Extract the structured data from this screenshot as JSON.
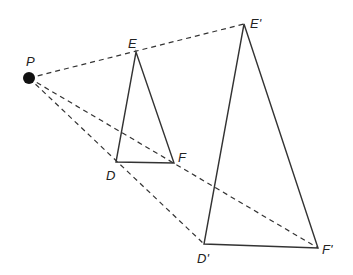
{
  "diagram": {
    "title": "",
    "center": {
      "label": "P",
      "x": 29,
      "y": 78
    },
    "original_triangle": {
      "vertices": [
        {
          "label": "D",
          "x": 116,
          "y": 162
        },
        {
          "label": "E",
          "x": 136,
          "y": 52
        },
        {
          "label": "F",
          "x": 174,
          "y": 163
        }
      ]
    },
    "image_triangle": {
      "vertices": [
        {
          "label": "D'",
          "x": 204,
          "y": 244
        },
        {
          "label": "E'",
          "x": 244,
          "y": 24
        },
        {
          "label": "F'",
          "x": 318,
          "y": 248
        }
      ]
    },
    "rays": [
      "P-E'",
      "P-D'",
      "P-F'"
    ],
    "colors": {
      "line": "#333333",
      "point": "#111111",
      "background": "#ffffff"
    }
  }
}
